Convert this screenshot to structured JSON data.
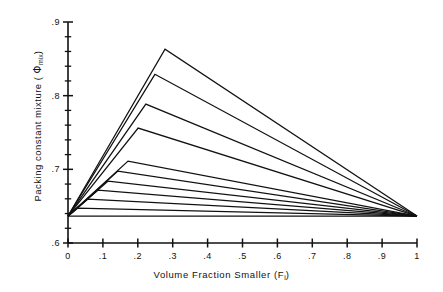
{
  "figure": {
    "background_color": "#ffffff",
    "line_color": "#111111"
  },
  "axes": {
    "x_label_prefix": "Volume Fraction Smaller (F",
    "x_label_sub": "i",
    "x_label_suffix": ")",
    "y_label_prefix": "Packing constant mixture ( ",
    "y_label_symbol": "Φ",
    "y_label_sub": "mix",
    "y_label_suffix": ")",
    "x_ticks": [
      "0",
      ".1",
      ".2",
      ".3",
      ".4",
      ".5",
      ".6",
      ".7",
      ".8",
      ".9",
      "1"
    ],
    "y_ticks": [
      ".6",
      ".7",
      ".8",
      ".9"
    ]
  },
  "chart_data": {
    "type": "line",
    "title": "",
    "xlabel": "Volume Fraction Smaller (F_i)",
    "ylabel": "Packing constant mixture (Φ_mix)",
    "xlim": [
      0,
      1
    ],
    "ylim": [
      0.6,
      0.9
    ],
    "x_major_ticks": [
      0,
      0.1,
      0.2,
      0.3,
      0.4,
      0.5,
      0.6,
      0.7,
      0.8,
      0.9,
      1.0
    ],
    "y_major_ticks": [
      0.6,
      0.7,
      0.8,
      0.9
    ],
    "y_minor_tick_step": 0.02,
    "grid": false,
    "legend": null,
    "common_start": {
      "x": 0.0,
      "y": 0.6366
    },
    "common_end": {
      "x": 1.0,
      "y": 0.6366
    },
    "envelope_peak": {
      "x": 0.278,
      "y": 0.863
    },
    "series": [
      {
        "name": "r = 1.0",
        "breakpoint": {
          "x": 0.0,
          "y": 0.6366
        },
        "x": [
          0.0,
          0.0,
          1.0
        ],
        "values": [
          0.6366,
          0.6366,
          0.6366
        ]
      },
      {
        "name": "r = 0.9",
        "breakpoint": {
          "x": 0.028,
          "y": 0.6475
        },
        "x": [
          0.0,
          0.028,
          1.0
        ],
        "values": [
          0.6366,
          0.6475,
          0.6366
        ]
      },
      {
        "name": "r = 0.8",
        "breakpoint": {
          "x": 0.057,
          "y": 0.6597
        },
        "x": [
          0.0,
          0.057,
          1.0
        ],
        "values": [
          0.6366,
          0.6597,
          0.6366
        ]
      },
      {
        "name": "r = 0.7",
        "breakpoint": {
          "x": 0.086,
          "y": 0.6719
        },
        "x": [
          0.0,
          0.086,
          1.0
        ],
        "values": [
          0.6366,
          0.6719,
          0.6366
        ]
      },
      {
        "name": "r = 0.6",
        "breakpoint": {
          "x": 0.115,
          "y": 0.6841
        },
        "x": [
          0.0,
          0.115,
          1.0
        ],
        "values": [
          0.6366,
          0.6841,
          0.6366
        ]
      },
      {
        "name": "r = 0.5",
        "breakpoint": {
          "x": 0.143,
          "y": 0.6976
        },
        "x": [
          0.0,
          0.143,
          1.0
        ],
        "values": [
          0.6366,
          0.6976,
          0.6366
        ]
      },
      {
        "name": "r = 0.4",
        "breakpoint": {
          "x": 0.172,
          "y": 0.7112
        },
        "x": [
          0.0,
          0.172,
          1.0
        ],
        "values": [
          0.6366,
          0.7112,
          0.6366
        ]
      },
      {
        "name": "r = 0.3",
        "breakpoint": {
          "x": 0.201,
          "y": 0.756
        },
        "x": [
          0.0,
          0.201,
          1.0
        ],
        "values": [
          0.6366,
          0.756,
          0.6366
        ]
      },
      {
        "name": "r = 0.2",
        "breakpoint": {
          "x": 0.223,
          "y": 0.7885
        },
        "x": [
          0.0,
          0.223,
          1.0
        ],
        "values": [
          0.6366,
          0.7885,
          0.6366
        ]
      },
      {
        "name": "r = 0.1",
        "breakpoint": {
          "x": 0.249,
          "y": 0.829
        },
        "x": [
          0.0,
          0.249,
          1.0
        ],
        "values": [
          0.6366,
          0.829,
          0.6366
        ]
      },
      {
        "name": "r = 0.0",
        "breakpoint": {
          "x": 0.278,
          "y": 0.863
        },
        "x": [
          0.0,
          0.278,
          1.0
        ],
        "values": [
          0.6366,
          0.863,
          0.6366
        ]
      }
    ]
  }
}
